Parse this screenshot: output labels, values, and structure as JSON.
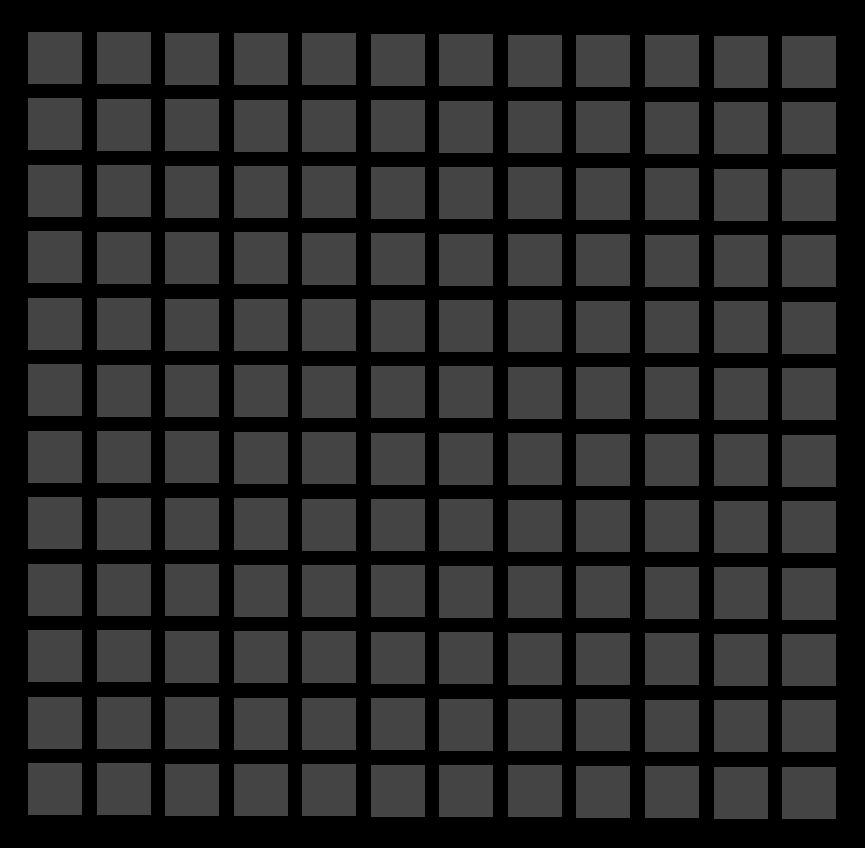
{
  "image": {
    "kind": "hermann-grid-illusion",
    "background_color": "#000000",
    "square_color": "#444444",
    "rows": 12,
    "columns": 12,
    "square_width": 54,
    "square_height": 52,
    "origin_x": 28,
    "origin_y": 32,
    "pitch_x": 68.55,
    "pitch_y": 66.45,
    "skew_y_per_col": 0.36
  }
}
